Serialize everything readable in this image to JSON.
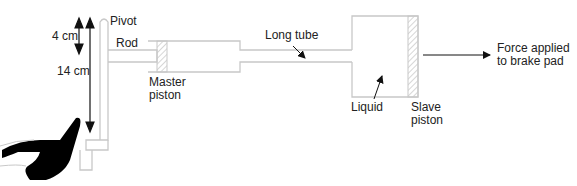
{
  "diagram": {
    "type": "hydraulic brake system",
    "labels": {
      "pivot": "Pivot",
      "rod": "Rod",
      "master_piston_line1": "Master",
      "master_piston_line2": "piston",
      "long_tube": "Long tube",
      "liquid": "Liquid",
      "slave_piston_line1": "Slave",
      "slave_piston_line2": "piston",
      "force_line1": "Force applied",
      "force_line2": "to brake pad",
      "dim_short": "4 cm",
      "dim_long": "14 cm"
    },
    "colors": {
      "outline": "#c8c8c8",
      "text": "#222222",
      "arrow": "#111111",
      "foot": "#000000"
    }
  }
}
